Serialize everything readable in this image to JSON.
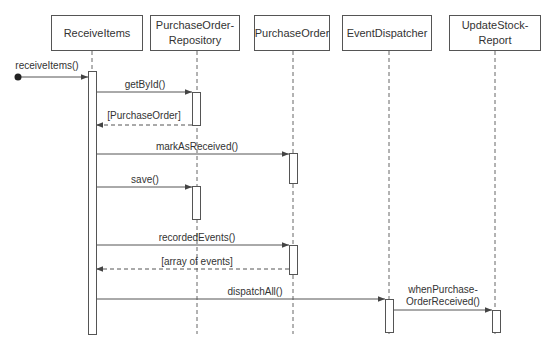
{
  "participants": [
    {
      "id": "receive-items",
      "label": "ReceiveItems",
      "x": 51,
      "w": 92,
      "lifeline_x": 92
    },
    {
      "id": "purchase-order-repository",
      "label": "PurchaseOrder-\nRepository",
      "x": 150,
      "w": 90,
      "lifeline_x": 197
    },
    {
      "id": "purchase-order",
      "label": "PurchaseOrder",
      "x": 254,
      "w": 76,
      "lifeline_x": 293
    },
    {
      "id": "event-dispatcher",
      "label": "EventDispatcher",
      "x": 342,
      "w": 90,
      "lifeline_x": 389
    },
    {
      "id": "update-stock-report",
      "label": "UpdateStock-\nReport",
      "x": 449,
      "w": 92,
      "lifeline_x": 495
    }
  ],
  "messages": [
    {
      "label": "receiveItems()",
      "from_x": 18,
      "to_x": 88,
      "y": 77,
      "type": "found",
      "label_x": 47,
      "label_y": 60
    },
    {
      "label": "getById()",
      "from_x": 96,
      "to_x": 192,
      "y": 92,
      "type": "sync",
      "label_x": 145,
      "label_y": 79
    },
    {
      "label": "[PurchaseOrder]",
      "from_x": 192,
      "to_x": 96,
      "y": 125,
      "type": "return",
      "label_x": 144,
      "label_y": 110
    },
    {
      "label": "markAsReceived()",
      "from_x": 96,
      "to_x": 289,
      "y": 154,
      "type": "sync",
      "label_x": 197,
      "label_y": 141
    },
    {
      "label": "save()",
      "from_x": 96,
      "to_x": 192,
      "y": 187,
      "type": "sync",
      "label_x": 145,
      "label_y": 174
    },
    {
      "label": "recordedEvents()",
      "from_x": 96,
      "to_x": 289,
      "y": 245,
      "type": "sync",
      "label_x": 197,
      "label_y": 232
    },
    {
      "label": "[array of events]",
      "from_x": 289,
      "to_x": 96,
      "y": 269,
      "type": "return",
      "label_x": 197,
      "label_y": 256
    },
    {
      "label": "dispatchAll()",
      "from_x": 96,
      "to_x": 385,
      "y": 299,
      "type": "sync",
      "label_x": 255,
      "label_y": 286
    },
    {
      "label": "whenPurchase-\nOrderReceived()",
      "from_x": 394,
      "to_x": 492,
      "y": 310,
      "type": "sync",
      "label_x": 443,
      "label_y": 284
    }
  ],
  "activations": [
    {
      "participant": "receive-items",
      "x": 88,
      "y": 71,
      "h": 263
    },
    {
      "participant": "purchase-order-repository",
      "x": 192,
      "y": 92,
      "h": 33
    },
    {
      "participant": "purchase-order",
      "x": 289,
      "y": 153,
      "h": 30
    },
    {
      "participant": "purchase-order-repository",
      "x": 192,
      "y": 186,
      "h": 33
    },
    {
      "participant": "purchase-order",
      "x": 289,
      "y": 245,
      "h": 29
    },
    {
      "participant": "event-dispatcher",
      "x": 385,
      "y": 299,
      "h": 33
    },
    {
      "participant": "update-stock-report",
      "x": 492,
      "y": 310,
      "h": 22
    }
  ],
  "colors": {
    "line": "#555555",
    "text": "#333333",
    "background": "#ffffff"
  }
}
